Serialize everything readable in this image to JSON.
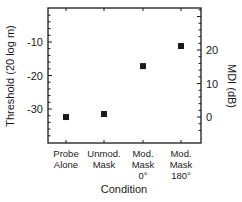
{
  "chart_data": {
    "type": "scatter",
    "title": "",
    "xlabel": "Condition",
    "ylabel": "Threshold (20 log m)",
    "y2label": "MDI (dB)",
    "categories": [
      {
        "lines": [
          "Probe",
          "Alone"
        ]
      },
      {
        "lines": [
          "Unmod.",
          "Mask"
        ]
      },
      {
        "lines": [
          "Mod.",
          "Mask",
          "0°"
        ]
      },
      {
        "lines": [
          "Mod.",
          "Mask",
          "180°"
        ]
      }
    ],
    "series": [
      {
        "name": "Threshold",
        "marker": "filled-square",
        "color": "#1a1a1a",
        "values": [
          -32.4,
          -31.5,
          -17.2,
          -11.2
        ]
      }
    ],
    "mdi_values": [
      0,
      0.9,
      15.2,
      21.2
    ],
    "ylim": [
      -38,
      -2
    ],
    "yticks": [
      -10,
      -20,
      -30
    ],
    "y2ticks": [
      20,
      10,
      0
    ],
    "y2_offset_from_y": 32.4,
    "grid": false,
    "legend": "none"
  }
}
